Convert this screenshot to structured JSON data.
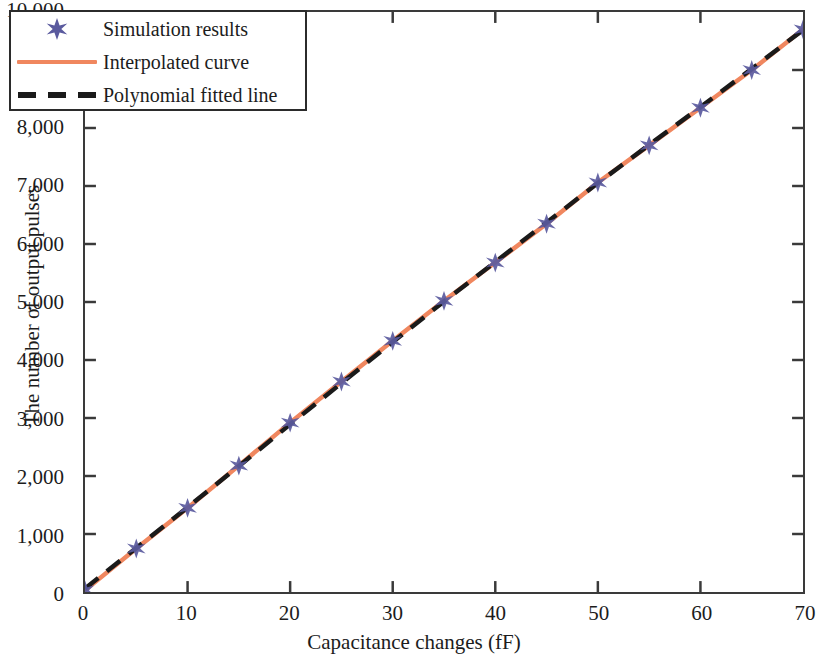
{
  "chart_data": {
    "type": "scatter",
    "title": "",
    "xlabel": "Capacitance changes (fF)",
    "ylabel": "The number of output pulses",
    "xlim": [
      0,
      70
    ],
    "ylim": [
      0,
      10000
    ],
    "grid": false,
    "legend_position": "upper left",
    "x_ticks": [
      "0",
      "10",
      "20",
      "30",
      "40",
      "50",
      "60",
      "70"
    ],
    "x_tick_values": [
      0,
      10,
      20,
      30,
      40,
      50,
      60,
      70
    ],
    "y_ticks": [
      "0",
      "1,000",
      "2,000",
      "3,000",
      "4,000",
      "5,000",
      "6,000",
      "7,000",
      "8,000",
      "9,000",
      "10,000"
    ],
    "y_tick_values": [
      0,
      1000,
      2000,
      3000,
      4000,
      5000,
      6000,
      7000,
      8000,
      9000,
      10000
    ],
    "x": [
      0,
      5,
      10,
      15,
      20,
      25,
      30,
      35,
      40,
      45,
      50,
      55,
      60,
      65,
      70
    ],
    "series": [
      {
        "name": "Simulation results",
        "style": "marker",
        "marker": "six-point-star",
        "color": "#5a5a9e",
        "values": [
          30,
          750,
          1450,
          2180,
          2920,
          3630,
          4330,
          5020,
          5680,
          6350,
          7060,
          7700,
          8350,
          9000,
          9700
        ]
      },
      {
        "name": "Interpolated curve",
        "style": "solid-line",
        "color": "#f0875f",
        "values": [
          30,
          750,
          1450,
          2180,
          2920,
          3630,
          4330,
          5020,
          5680,
          6350,
          7060,
          7700,
          8350,
          9000,
          9700
        ]
      },
      {
        "name": "Polynomial fitted line",
        "style": "dashed-line",
        "color": "#1a1a1a",
        "values": [
          60,
          760,
          1460,
          2170,
          2890,
          3600,
          4310,
          5010,
          5690,
          6370,
          7050,
          7710,
          8360,
          9020,
          9690
        ]
      }
    ]
  },
  "axes": {
    "x_title": "Capacitance changes (fF)",
    "y_title": "The number of output pulses"
  },
  "legend": {
    "items": [
      {
        "label": "Simulation results",
        "icon": "star-marker-icon"
      },
      {
        "label": "Interpolated curve",
        "icon": "solid-line-icon"
      },
      {
        "label": "Polynomial fitted line",
        "icon": "dashed-line-icon"
      }
    ]
  }
}
